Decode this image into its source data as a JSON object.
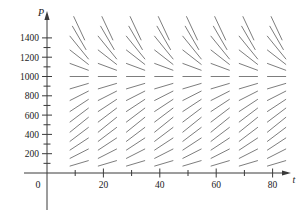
{
  "figure": {
    "title": "",
    "axis_x_name": "t",
    "axis_y_name": "P",
    "origin_label": "0"
  },
  "chart_data": {
    "type": "scatter",
    "subtype": "slope-field",
    "title": "",
    "xlabel": "t",
    "ylabel": "P",
    "xlim": [
      0,
      90
    ],
    "ylim": [
      0,
      1550
    ],
    "grid": false,
    "legend": null,
    "equilibrium_line": 1000,
    "model": "dP/dt = k*P*(1 - P/1000)",
    "x_ticks": [
      10,
      20,
      30,
      40,
      50,
      60,
      70,
      80
    ],
    "x_tick_labels": [
      "",
      "20",
      "",
      "40",
      "",
      "60",
      "",
      "80"
    ],
    "y_ticks": [
      100,
      200,
      300,
      400,
      500,
      600,
      700,
      800,
      900,
      1000,
      1100,
      1200,
      1300,
      1400
    ],
    "y_tick_labels": [
      "",
      "200",
      "",
      "400",
      "",
      "600",
      "",
      "800",
      "",
      "1000",
      "",
      "1200",
      "",
      "1400"
    ],
    "field_x_values": [
      10,
      20,
      30,
      40,
      50,
      60,
      70,
      80
    ],
    "field_y_values": [
      100,
      200,
      300,
      400,
      500,
      600,
      700,
      800,
      900,
      1000,
      1100,
      1200,
      1300,
      1400,
      1500
    ],
    "slopes_by_y": {
      "100": 0.36,
      "200": 0.62,
      "300": 0.8,
      "400": 0.92,
      "500": 0.98,
      "600": 0.92,
      "700": 0.8,
      "800": 0.62,
      "900": 0.36,
      "1000": 0.0,
      "1100": -0.45,
      "1200": -0.95,
      "1300": -1.5,
      "1400": -2.1,
      "1500": -2.6
    }
  },
  "colors": {
    "axis": "#3a3a3a",
    "segment": "#6e6e6e",
    "text": "#1a1a1a",
    "background": "#ffffff"
  }
}
